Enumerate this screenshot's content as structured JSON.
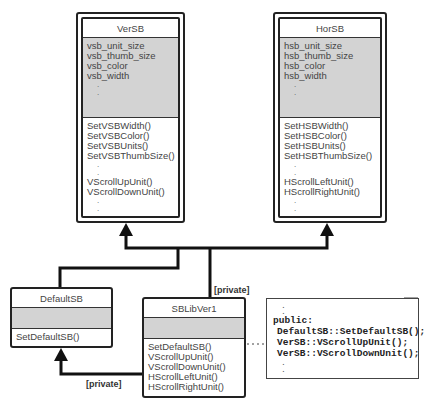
{
  "classes": {
    "versb": {
      "name": "VerSB",
      "attributes": [
        "vsb_unit_size",
        "vsb_thumb_size",
        "vsb_color",
        "vsb_width"
      ],
      "methods_a": [
        "SetVSBWidth()",
        "SetVSBColor()",
        "SetVSBUnits()",
        "SetVSBThumbSize()"
      ],
      "methods_b": [
        "VScrollUpUnit()",
        "VScrollDownUnit()"
      ]
    },
    "horsb": {
      "name": "HorSB",
      "attributes": [
        "hsb_unit_size",
        "hsb_thumb_size",
        "hsb_color",
        "hsb_width"
      ],
      "methods_a": [
        "SetHSBWidth()",
        "SetHSBColor()",
        "SetHSBUnits()",
        "SetHSBThumbSize()"
      ],
      "methods_b": [
        "HScrollLeftUnit()",
        "HScrollRightUnit()"
      ]
    },
    "defaultsb": {
      "name": "DefaultSB",
      "methods": [
        "SetDefaultSB()"
      ]
    },
    "sblibver1": {
      "name": "SBLibVer1",
      "methods": [
        "SetDefaultSB()",
        "VScrollUpUnit()",
        "VScrollDownUnit()",
        "HScrollLeftUnit()",
        "HScrollRightUnit()"
      ]
    }
  },
  "labels": {
    "private_top": "[private]",
    "private_bottom": "[private]"
  },
  "note": {
    "keyword": "public:",
    "lines": [
      "DefaultSB::SetDefaultSB();",
      "VerSB::VScrollUpUnit();",
      "VerSB::VScrollDownUnit();"
    ],
    "ellipsis": "."
  },
  "ellipsis": "."
}
